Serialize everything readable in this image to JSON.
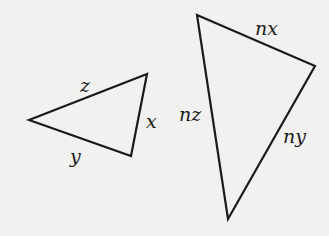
{
  "diagram": {
    "background": "#f1f1ef",
    "stroke": "#1a1a1a",
    "triangles": [
      {
        "name": "small-triangle",
        "vertices": [
          [
            29,
            120
          ],
          [
            147,
            74
          ],
          [
            131,
            156
          ]
        ],
        "labels": [
          {
            "text": "z",
            "x": 80,
            "y": 92
          },
          {
            "text": "x",
            "x": 146,
            "y": 128
          },
          {
            "text": "y",
            "x": 70,
            "y": 163
          }
        ]
      },
      {
        "name": "large-triangle",
        "vertices": [
          [
            197,
            15
          ],
          [
            315,
            66
          ],
          [
            228,
            219
          ]
        ],
        "labels": [
          {
            "text": "nx",
            "x": 255,
            "y": 35
          },
          {
            "text": "nz",
            "x": 179,
            "y": 121
          },
          {
            "text": "ny",
            "x": 283,
            "y": 143
          }
        ]
      }
    ]
  }
}
